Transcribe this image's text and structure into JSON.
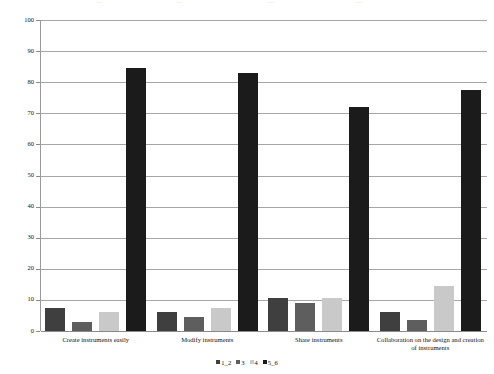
{
  "chart_data": {
    "type": "bar",
    "title": "",
    "xlabel": "",
    "ylabel": "",
    "ylim": [
      0,
      100
    ],
    "ytick_step": 10,
    "yticks": [
      100,
      90,
      80,
      70,
      60,
      50,
      40,
      30,
      20,
      10,
      0
    ],
    "grid": true,
    "legend_position": "bottom",
    "categories": [
      "Create instruments easily",
      "Modify instruments",
      "Share instruments",
      "Collaboration on the design and creation of instruments"
    ],
    "category_lines": [
      [
        "Create instruments easily"
      ],
      [
        "Modify instruments"
      ],
      [
        "Share instruments"
      ],
      [
        "Collaboration on the design and creation",
        "of instruments"
      ]
    ],
    "series": [
      {
        "name": "1_2",
        "color": "#3f3f3f",
        "values": [
          7.5,
          6.0,
          10.5,
          6.0
        ]
      },
      {
        "name": "3",
        "color": "#5e5e5e",
        "values": [
          3.0,
          4.5,
          9.0,
          3.5
        ]
      },
      {
        "name": "4",
        "color": "#c9c9c9",
        "values": [
          6.0,
          7.5,
          10.5,
          14.5
        ]
      },
      {
        "name": "5_6",
        "color": "#1b1b1b",
        "values": [
          84.5,
          83.0,
          72.0,
          77.5
        ]
      }
    ]
  },
  "artifact": {
    "fragments": [
      "...",
      "...",
      "...",
      "..."
    ]
  }
}
